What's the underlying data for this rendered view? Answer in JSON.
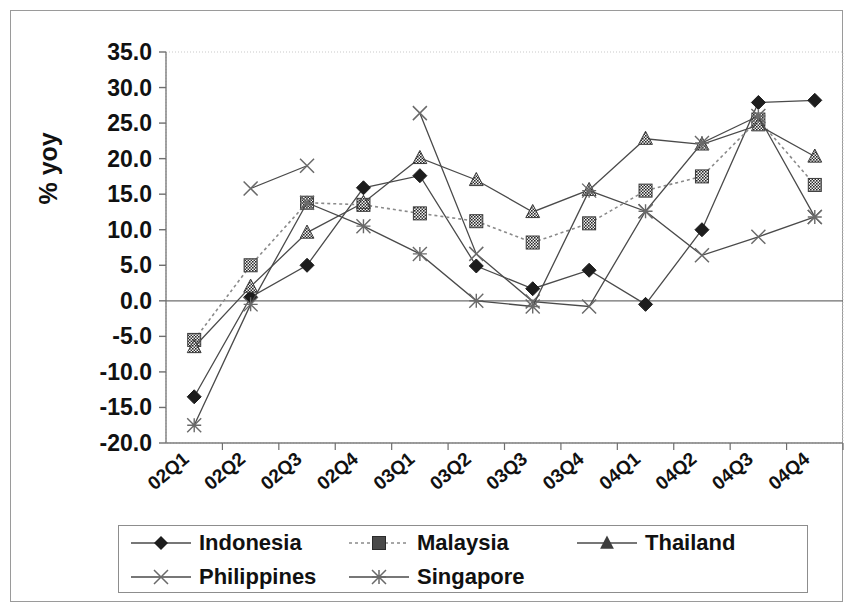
{
  "axis": {
    "ylabel": "% yoy",
    "yticks": [
      "35.0",
      "30.0",
      "25.0",
      "20.0",
      "15.0",
      "10.0",
      "5.0",
      "0.0",
      "-5.0",
      "-10.0",
      "-15.0",
      "-20.0"
    ],
    "xticks": [
      "02Q1",
      "02Q2",
      "02Q3",
      "02Q4",
      "03Q1",
      "03Q2",
      "03Q3",
      "03Q4",
      "04Q1",
      "04Q2",
      "04Q3",
      "04Q4"
    ]
  },
  "legend": {
    "items": [
      {
        "label": "Indonesia",
        "marker": "diamond",
        "dash": "solid"
      },
      {
        "label": "Malaysia",
        "marker": "square",
        "dash": "dotted"
      },
      {
        "label": "Thailand",
        "marker": "triangle",
        "dash": "solid"
      },
      {
        "label": "Philippines",
        "marker": "cross",
        "dash": "solid"
      },
      {
        "label": "Singapore",
        "marker": "asterisk",
        "dash": "solid"
      }
    ]
  },
  "chart_data": {
    "type": "line",
    "title": "",
    "xlabel": "",
    "ylabel": "% yoy",
    "ylim": [
      -20.0,
      35.0
    ],
    "ytick_step": 5.0,
    "grid": false,
    "legend_position": "bottom",
    "categories": [
      "02Q1",
      "02Q2",
      "02Q3",
      "02Q4",
      "03Q1",
      "03Q2",
      "03Q3",
      "03Q4",
      "04Q1",
      "04Q2",
      "04Q3",
      "04Q4"
    ],
    "series": [
      {
        "name": "Indonesia",
        "marker": "diamond",
        "dash": "solid",
        "values": [
          -13.5,
          0.5,
          5.0,
          15.9,
          17.6,
          4.9,
          1.7,
          4.3,
          -0.5,
          10.0,
          27.9,
          28.2
        ]
      },
      {
        "name": "Malaysia",
        "marker": "square",
        "dash": "dotted",
        "values": [
          -5.5,
          5.0,
          13.8,
          13.5,
          12.3,
          11.2,
          8.2,
          10.9,
          15.5,
          17.5,
          25.5,
          16.3
        ]
      },
      {
        "name": "Thailand",
        "marker": "triangle",
        "dash": "solid",
        "values": [
          -6.5,
          2.0,
          9.6,
          13.8,
          20.1,
          17.0,
          12.5,
          15.6,
          22.8,
          22.0,
          24.7,
          20.3
        ]
      },
      {
        "name": "Philippines",
        "marker": "cross",
        "dash": "solid",
        "values": [
          null,
          15.8,
          19.0,
          null,
          26.4,
          6.6,
          -0.1,
          -0.8,
          12.6,
          6.4,
          9.0,
          11.8
        ]
      },
      {
        "name": "Singapore",
        "marker": "asterisk",
        "dash": "solid",
        "values": [
          -17.5,
          -0.5,
          13.8,
          10.5,
          6.6,
          0.0,
          -0.8,
          15.5,
          12.6,
          22.2,
          26.0,
          11.8
        ]
      }
    ]
  }
}
